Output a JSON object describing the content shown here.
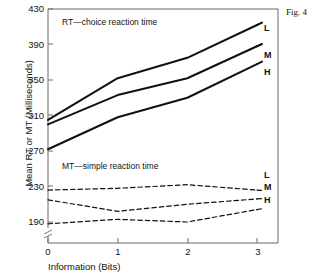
{
  "figure": {
    "caption": "Fig. 4"
  },
  "chart_data": {
    "type": "line",
    "title": "",
    "xlabel": "Information (Bits)",
    "ylabel": "Mean RT or MT (Milliseconds)",
    "x": [
      0,
      1,
      2,
      3
    ],
    "xticklabels": [
      "0",
      "1",
      "2",
      "3"
    ],
    "xlim": [
      0,
      3
    ],
    "yticklabels": [
      "190",
      "230",
      "270",
      "310",
      "350",
      "390",
      "430"
    ],
    "yticks": [
      190,
      230,
      270,
      310,
      350,
      390,
      430
    ],
    "ylim": [
      186,
      430
    ],
    "grid": false,
    "axis_break": true,
    "legend_position": "right-of-axis",
    "annotations": [
      {
        "text": "RT—choice reaction time",
        "x": 0.25,
        "y": 410
      },
      {
        "text": "MT—simple reaction time",
        "x": 0.28,
        "y": 258
      }
    ],
    "series": [
      {
        "name": "L",
        "group": "RT",
        "style": "solid",
        "label": "L",
        "values": [
          305,
          352,
          375,
          412
        ]
      },
      {
        "name": "M",
        "group": "RT",
        "style": "solid",
        "label": "M",
        "values": [
          300,
          333,
          352,
          388
        ]
      },
      {
        "name": "H",
        "group": "RT",
        "style": "solid",
        "label": "H",
        "values": [
          272,
          308,
          330,
          368
        ]
      },
      {
        "name": "L",
        "group": "MT",
        "style": "dashed",
        "label": "L",
        "values": [
          226,
          228,
          232,
          226
        ]
      },
      {
        "name": "M",
        "group": "MT",
        "style": "dashed",
        "label": "M",
        "values": [
          215,
          202,
          210,
          216
        ]
      },
      {
        "name": "H",
        "group": "MT",
        "style": "dashed",
        "label": "H",
        "values": [
          188,
          193,
          190,
          204
        ]
      }
    ]
  },
  "labels": {
    "rt_l": "L",
    "rt_m": "M",
    "rt_h": "H",
    "mt_l": "L",
    "mt_m": "M",
    "mt_h": "H",
    "ytick_430": "430",
    "ytick_390": "390",
    "ytick_350": "350",
    "ytick_310": "310",
    "ytick_270": "270",
    "ytick_230": "230",
    "ytick_190": "190",
    "xtick_0": "0",
    "xtick_1": "1",
    "xtick_2": "2",
    "xtick_3": "3",
    "annot_rt": "RT—choice reaction time",
    "annot_mt": "MT—simple reaction time",
    "x_axis_title": "Information (Bits)",
    "y_axis_title": "Mean RT or MT (Milliseconds)"
  },
  "colors": {
    "ink": "#111111",
    "axis": "#555555",
    "background": "#ffffff"
  }
}
